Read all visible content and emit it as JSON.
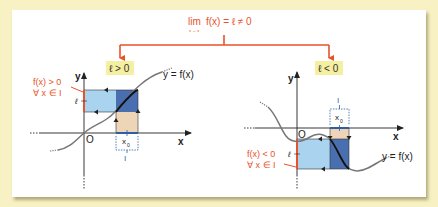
{
  "header": {
    "limit_prefix": "lim",
    "limit_sub": "x → x",
    "limit_sub_index": "0",
    "limit_expr": "f(x) = ℓ ≠ 0"
  },
  "cases": [
    {
      "id": "positive",
      "label": "ℓ > 0",
      "y_label": "y",
      "x_label": "x",
      "origin_label": "O",
      "ell_label": "ℓ",
      "curve_label": "y = f(x)",
      "x0_label": "x",
      "x0_sub": "0",
      "interval_label": "I",
      "condition_line1": "f(x) > 0",
      "condition_line2": "∀ x ∈ I"
    },
    {
      "id": "negative",
      "label": "ℓ < 0",
      "y_label": "y",
      "x_label": "x",
      "origin_label": "O",
      "ell_label": "ℓ",
      "curve_label": "y = f(x)",
      "x0_label": "x",
      "x0_sub": "0",
      "interval_label": "I",
      "condition_line1": "f(x) < 0",
      "condition_line2": "∀ x ∈ I"
    }
  ],
  "colors": {
    "page_bg": "#f8f1c4",
    "accent_red": "#e8522b",
    "label_bg": "#f5efa0",
    "light_blue": "#a9d3ef",
    "dark_blue": "#4a6fb0",
    "tan": "#efd5b8",
    "interval_blue": "#2c5fa8",
    "curve_gray": "#777777"
  }
}
